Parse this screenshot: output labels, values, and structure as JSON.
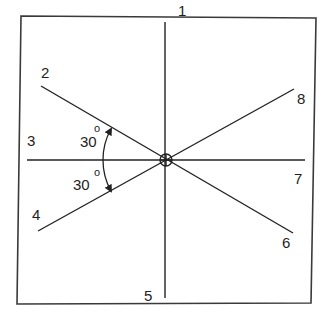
{
  "diagram": {
    "type": "radial-direction-diagram",
    "frame": {
      "stroke": "#3a3a3a"
    },
    "line_color": "#222222",
    "center": {
      "x": 166,
      "y": 160,
      "symbol": "circle-with-cross"
    },
    "directions": [
      {
        "id": 1,
        "label": "1",
        "angle_deg": 90
      },
      {
        "id": 2,
        "label": "2",
        "angle_deg": 150
      },
      {
        "id": 3,
        "label": "3",
        "angle_deg": 180
      },
      {
        "id": 4,
        "label": "4",
        "angle_deg": 210
      },
      {
        "id": 5,
        "label": "5",
        "angle_deg": 270
      },
      {
        "id": 6,
        "label": "6",
        "angle_deg": 330
      },
      {
        "id": 7,
        "label": "7",
        "angle_deg": 0
      },
      {
        "id": 8,
        "label": "8",
        "angle_deg": 30
      }
    ],
    "angle_annotations": [
      {
        "value": "30",
        "unit": "o",
        "between": [
          "2",
          "3"
        ]
      },
      {
        "value": "30",
        "unit": "o",
        "between": [
          "3",
          "4"
        ]
      }
    ]
  }
}
